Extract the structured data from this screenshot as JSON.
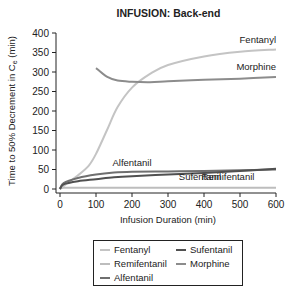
{
  "chart_data": {
    "type": "line",
    "title": "INFUSION: Back-end",
    "xlabel": "Infusion Duration (min)",
    "ylabel": "Time to 50% Decrement in Ce (min)",
    "xlim": [
      0,
      600
    ],
    "ylim": [
      0,
      400
    ],
    "x_ticks": [
      "0",
      "100",
      "200",
      "300",
      "400",
      "500",
      "600"
    ],
    "y_ticks": [
      "0",
      "50",
      "100",
      "150",
      "200",
      "250",
      "300",
      "350",
      "400"
    ],
    "grid": false,
    "legend_position": "bottom",
    "series": [
      {
        "name": "Fentanyl",
        "color": "#c4c4c4",
        "x": [
          0,
          20,
          50,
          80,
          100,
          130,
          160,
          200,
          250,
          300,
          400,
          500,
          600
        ],
        "y": [
          0,
          15,
          35,
          60,
          90,
          150,
          210,
          260,
          295,
          318,
          340,
          352,
          358
        ]
      },
      {
        "name": "Remifentanil",
        "color": "#bdbdbd",
        "x": [
          0,
          10,
          100,
          200,
          300,
          400,
          500,
          600
        ],
        "y": [
          0,
          3,
          3,
          3,
          3,
          3,
          3,
          3
        ]
      },
      {
        "name": "Alfentanil",
        "color": "#6f6f6f",
        "x": [
          0,
          10,
          50,
          100,
          150,
          200,
          300,
          400,
          500,
          600
        ],
        "y": [
          0,
          15,
          28,
          37,
          42,
          44,
          45,
          46,
          48,
          50
        ]
      },
      {
        "name": "Sufentanil",
        "color": "#505050",
        "x": [
          0,
          10,
          50,
          100,
          150,
          200,
          300,
          400,
          500,
          600
        ],
        "y": [
          0,
          12,
          20,
          25,
          30,
          33,
          37,
          41,
          46,
          52
        ]
      },
      {
        "name": "Morphine",
        "color": "#8c8c8c",
        "x": [
          100,
          130,
          160,
          200,
          250,
          300,
          400,
          500,
          600
        ],
        "y": [
          310,
          288,
          278,
          275,
          274,
          276,
          280,
          283,
          287
        ]
      }
    ],
    "annotations": [
      {
        "text": "Fentanyl",
        "x": 600,
        "y": 375
      },
      {
        "text": "Morphine",
        "x": 600,
        "y": 305
      },
      {
        "text": "Alfentanil",
        "x": 200,
        "y": 60
      },
      {
        "text": "Sufentanil",
        "x": 330,
        "y": 22
      },
      {
        "text": "Remifentanil",
        "x": 540,
        "y": 22
      }
    ]
  },
  "labels": {
    "title": "INFUSION: Back-end",
    "xlabel": "Infusion Duration (min)",
    "ylabel": "Time to 50% Decrement in C",
    "ylabel_sub": "e",
    "ylabel_tail": " (min)"
  },
  "legend": [
    {
      "name": "Fentanyl",
      "color": "#c4c4c4"
    },
    {
      "name": "Sufentanil",
      "color": "#505050"
    },
    {
      "name": "Remifentanil",
      "color": "#bdbdbd"
    },
    {
      "name": "Morphine",
      "color": "#8c8c8c"
    },
    {
      "name": "Alfentanil",
      "color": "#6f6f6f"
    }
  ]
}
